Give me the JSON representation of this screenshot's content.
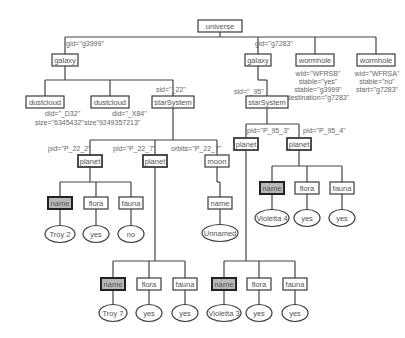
{
  "diagram": {
    "nodes": [
      {
        "id": "universe",
        "label": "universe",
        "x": 220,
        "y": 26,
        "w": 44,
        "shape": "box"
      },
      {
        "id": "galaxy1",
        "label": "galaxy",
        "x": 65,
        "y": 60,
        "w": 26,
        "shape": "box"
      },
      {
        "id": "galaxy2",
        "label": "galaxy",
        "x": 258,
        "y": 60,
        "w": 26,
        "shape": "box"
      },
      {
        "id": "wormhole1",
        "label": "wormhole",
        "x": 315,
        "y": 60,
        "w": 38,
        "shape": "box"
      },
      {
        "id": "wormhole2",
        "label": "wormhole",
        "x": 376,
        "y": 60,
        "w": 38,
        "shape": "box"
      },
      {
        "id": "dustcloud1",
        "label": "dustcloud",
        "x": 45,
        "y": 102,
        "w": 38,
        "shape": "box"
      },
      {
        "id": "dustcloud2",
        "label": "dustcloud",
        "x": 110,
        "y": 102,
        "w": 38,
        "shape": "box"
      },
      {
        "id": "starSystem1",
        "label": "starSystem",
        "x": 173,
        "y": 102,
        "w": 42,
        "shape": "box"
      },
      {
        "id": "starSystem2",
        "label": "starSystem",
        "x": 267,
        "y": 102,
        "w": 42,
        "shape": "box"
      },
      {
        "id": "planet1",
        "label": "planet",
        "x": 90,
        "y": 161,
        "w": 24,
        "shape": "box",
        "bold": true
      },
      {
        "id": "planet2",
        "label": "planet",
        "x": 155,
        "y": 161,
        "w": 24,
        "shape": "box",
        "bold": true
      },
      {
        "id": "moon",
        "label": "moon",
        "x": 217,
        "y": 161,
        "w": 24,
        "shape": "box"
      },
      {
        "id": "planet3",
        "label": "planet",
        "x": 246,
        "y": 144,
        "w": 24,
        "shape": "box",
        "bold": true
      },
      {
        "id": "planet4",
        "label": "planet",
        "x": 299,
        "y": 144,
        "w": 24,
        "shape": "box",
        "bold": true
      },
      {
        "id": "name1",
        "label": "name",
        "x": 60,
        "y": 203,
        "w": 24,
        "shape": "box",
        "key": true
      },
      {
        "id": "flora1",
        "label": "flora",
        "x": 96,
        "y": 203,
        "w": 24,
        "shape": "box"
      },
      {
        "id": "fauna1",
        "label": "fauna",
        "x": 131,
        "y": 203,
        "w": 24,
        "shape": "box"
      },
      {
        "id": "moonname",
        "label": "name",
        "x": 220,
        "y": 203,
        "w": 24,
        "shape": "box"
      },
      {
        "id": "name4",
        "label": "name",
        "x": 272,
        "y": 188,
        "w": 24,
        "shape": "box",
        "key": true
      },
      {
        "id": "flora4",
        "label": "flora",
        "x": 307,
        "y": 188,
        "w": 24,
        "shape": "box"
      },
      {
        "id": "fauna4",
        "label": "fauna",
        "x": 342,
        "y": 188,
        "w": 24,
        "shape": "box"
      },
      {
        "id": "name2",
        "label": "name",
        "x": 113,
        "y": 284,
        "w": 24,
        "shape": "box",
        "key": true
      },
      {
        "id": "flora2",
        "label": "flora",
        "x": 149,
        "y": 284,
        "w": 24,
        "shape": "box"
      },
      {
        "id": "fauna2",
        "label": "fauna",
        "x": 185,
        "y": 284,
        "w": 24,
        "shape": "box"
      },
      {
        "id": "name3",
        "label": "name",
        "x": 224,
        "y": 284,
        "w": 24,
        "shape": "box",
        "key": true
      },
      {
        "id": "flora3",
        "label": "flora",
        "x": 259,
        "y": 284,
        "w": 24,
        "shape": "box"
      },
      {
        "id": "fauna3",
        "label": "fauna",
        "x": 295,
        "y": 284,
        "w": 24,
        "shape": "box"
      },
      {
        "id": "v_troy2",
        "label": "Troy 2",
        "x": 60,
        "y": 234,
        "w": 30,
        "shape": "ellipse"
      },
      {
        "id": "v_yes1",
        "label": "yes",
        "x": 96,
        "y": 234,
        "w": 26,
        "shape": "ellipse"
      },
      {
        "id": "v_no1",
        "label": "no",
        "x": 131,
        "y": 234,
        "w": 26,
        "shape": "ellipse"
      },
      {
        "id": "v_unnamed",
        "label": "Unnamed",
        "x": 220,
        "y": 233,
        "w": 36,
        "shape": "ellipse"
      },
      {
        "id": "v_violetta4",
        "label": "Violetta 4",
        "x": 272,
        "y": 218,
        "w": 34,
        "shape": "ellipse"
      },
      {
        "id": "v_yes4a",
        "label": "yes",
        "x": 307,
        "y": 218,
        "w": 26,
        "shape": "ellipse"
      },
      {
        "id": "v_yes4b",
        "label": "yes",
        "x": 342,
        "y": 218,
        "w": 26,
        "shape": "ellipse"
      },
      {
        "id": "v_troy7",
        "label": "Troy 7",
        "x": 113,
        "y": 313,
        "w": 28,
        "shape": "ellipse"
      },
      {
        "id": "v_yes2a",
        "label": "yes",
        "x": 149,
        "y": 313,
        "w": 26,
        "shape": "ellipse"
      },
      {
        "id": "v_yes2b",
        "label": "yes",
        "x": 185,
        "y": 313,
        "w": 26,
        "shape": "ellipse"
      },
      {
        "id": "v_violetta3",
        "label": "Violetta 3",
        "x": 224,
        "y": 313,
        "w": 34,
        "shape": "ellipse"
      },
      {
        "id": "v_yes3a",
        "label": "yes",
        "x": 259,
        "y": 313,
        "w": 26,
        "shape": "ellipse"
      },
      {
        "id": "v_yes3b",
        "label": "yes",
        "x": 295,
        "y": 313,
        "w": 26,
        "shape": "ellipse"
      }
    ],
    "edges": [
      {
        "from": "universe",
        "to": [
          "galaxy1",
          "galaxy2",
          "wormhole1",
          "wormhole2"
        ],
        "bus_y": 37
      },
      {
        "from": "galaxy1",
        "to": [
          "dustcloud1",
          "dustcloud2",
          "starSystem1"
        ],
        "bus_y": 80
      },
      {
        "from": "galaxy2",
        "to": [
          "starSystem2"
        ],
        "bus_y": 80
      },
      {
        "from": "starSystem1",
        "to": [
          "planet1",
          "planet2",
          "moon"
        ],
        "bus_y": 140
      },
      {
        "from": "starSystem2",
        "to": [
          "planet3",
          "planet4"
        ],
        "bus_y": 124
      },
      {
        "from": "planet1",
        "to": [
          "name1",
          "flora1",
          "fauna1"
        ],
        "bus_y": 182
      },
      {
        "from": "planet2",
        "to": [
          "name2",
          "flora2",
          "fauna2"
        ],
        "bus_y": 261
      },
      {
        "from": "moon",
        "to": [
          "moonname"
        ],
        "bus_y": 182
      },
      {
        "from": "planet3",
        "to": [
          "name3",
          "flora3",
          "fauna3"
        ],
        "bus_y": 261
      },
      {
        "from": "planet4",
        "to": [
          "name4",
          "flora4",
          "fauna4"
        ],
        "bus_y": 166
      },
      {
        "from": "name1",
        "to": [
          "v_troy2"
        ]
      },
      {
        "from": "flora1",
        "to": [
          "v_yes1"
        ]
      },
      {
        "from": "fauna1",
        "to": [
          "v_no1"
        ]
      },
      {
        "from": "moonname",
        "to": [
          "v_unnamed"
        ]
      },
      {
        "from": "name4",
        "to": [
          "v_violetta4"
        ]
      },
      {
        "from": "flora4",
        "to": [
          "v_yes4a"
        ]
      },
      {
        "from": "fauna4",
        "to": [
          "v_yes4b"
        ]
      },
      {
        "from": "name2",
        "to": [
          "v_troy7"
        ]
      },
      {
        "from": "flora2",
        "to": [
          "v_yes2a"
        ]
      },
      {
        "from": "fauna2",
        "to": [
          "v_yes2b"
        ]
      },
      {
        "from": "name3",
        "to": [
          "v_violetta3"
        ]
      },
      {
        "from": "flora3",
        "to": [
          "v_yes3a"
        ]
      },
      {
        "from": "fauna3",
        "to": [
          "v_yes3b"
        ]
      }
    ],
    "attributes": [
      {
        "text": "gid=\"g3999\"",
        "x": 66,
        "y": 46,
        "anchor": "start"
      },
      {
        "text": "gid=\"g7283\"",
        "x": 255,
        "y": 46,
        "anchor": "start"
      },
      {
        "text": "wid=\"WFRSB\"",
        "x": 318,
        "y": 76,
        "anchor": "middle"
      },
      {
        "text": "stable=\"yes\"",
        "x": 318,
        "y": 84,
        "anchor": "middle"
      },
      {
        "text": "stable=\"g3999\"",
        "x": 318,
        "y": 92,
        "anchor": "middle"
      },
      {
        "text": "destination=\"g7283\"",
        "x": 318,
        "y": 100,
        "anchor": "middle"
      },
      {
        "text": "wid=\"WFRSA\"",
        "x": 377,
        "y": 76,
        "anchor": "middle"
      },
      {
        "text": "stable=\"no\"",
        "x": 377,
        "y": 84,
        "anchor": "middle"
      },
      {
        "text": "start=\"g7283\"",
        "x": 377,
        "y": 92,
        "anchor": "middle"
      },
      {
        "text": "sid=\"_22\"",
        "x": 156,
        "y": 92,
        "anchor": "start"
      },
      {
        "text": "sid=\"_95\"",
        "x": 234,
        "y": 94,
        "anchor": "start"
      },
      {
        "text": "did=\"_D32\"",
        "x": 45,
        "y": 116,
        "anchor": "start"
      },
      {
        "text": "size=\"6345432\"",
        "x": 35,
        "y": 125,
        "anchor": "start"
      },
      {
        "text": "did=\"_X84\"",
        "x": 112,
        "y": 116,
        "anchor": "start"
      },
      {
        "text": "size\"9249357213\"",
        "x": 84,
        "y": 125,
        "anchor": "start"
      },
      {
        "text": "pid=\"P_22_2\"",
        "x": 48,
        "y": 151,
        "anchor": "start"
      },
      {
        "text": "pid=\"P_22_7\"",
        "x": 113,
        "y": 151,
        "anchor": "start"
      },
      {
        "text": "orbits=\"P_22_7\"",
        "x": 171,
        "y": 151,
        "anchor": "start"
      },
      {
        "text": "pid=\"P_95_3\"",
        "x": 247,
        "y": 133,
        "anchor": "start"
      },
      {
        "text": "pid=\"P_95_4\"",
        "x": 303,
        "y": 133,
        "anchor": "start"
      }
    ]
  }
}
